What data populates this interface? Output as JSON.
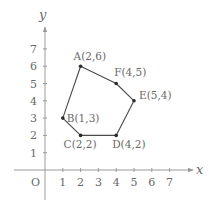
{
  "diagram": {
    "type": "coordinate-polygon",
    "axes": {
      "x_label": "x",
      "y_label": "y",
      "origin_label": "O",
      "x_ticks": [
        "1",
        "2",
        "3",
        "4",
        "5",
        "6",
        "7"
      ],
      "y_ticks": [
        "1",
        "2",
        "3",
        "4",
        "5",
        "6",
        "7"
      ]
    },
    "points": [
      {
        "name": "A",
        "x": 2,
        "y": 6,
        "label": "A(2,6)"
      },
      {
        "name": "F",
        "x": 4,
        "y": 5,
        "label": "F(4,5)"
      },
      {
        "name": "E",
        "x": 5,
        "y": 4,
        "label": "E(5,4)"
      },
      {
        "name": "D",
        "x": 4,
        "y": 2,
        "label": "D(4,2)"
      },
      {
        "name": "C",
        "x": 2,
        "y": 2,
        "label": "C(2,2)"
      },
      {
        "name": "B",
        "x": 1,
        "y": 3,
        "label": "B(1,3)"
      }
    ],
    "polygon_order": [
      "A",
      "F",
      "E",
      "D",
      "C",
      "B"
    ],
    "colors": {
      "axis": "#9a9a9a",
      "polygon": "#4a4a4a",
      "text": "#6a6a6a"
    }
  }
}
